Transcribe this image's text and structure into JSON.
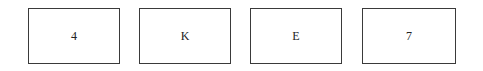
{
  "cards": [
    {
      "label": "4"
    },
    {
      "label": "K"
    },
    {
      "label": "E"
    },
    {
      "label": "7"
    }
  ]
}
